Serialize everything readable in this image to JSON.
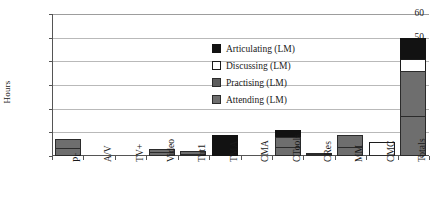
{
  "chart_data": {
    "type": "bar",
    "subtype": "stacked-bar",
    "title": "",
    "xlabel": "",
    "ylabel": "Hours",
    "ylim": [
      0,
      60
    ],
    "ytick_values": [
      0,
      10,
      20,
      30,
      40,
      50,
      60
    ],
    "ytick_labels": [
      "0",
      "10",
      "20",
      "30",
      "40",
      "50",
      "60"
    ],
    "grid": true,
    "legend_position": "inside-upper-right",
    "categories": [
      "Pr",
      "A/V",
      "TV+",
      "Video",
      "Tut1",
      "TMA",
      "CMA",
      "CTools",
      "CRes",
      "MM",
      "CMC",
      "Totals"
    ],
    "series": [
      {
        "name": "Attending (LM)",
        "color": "#6e6e6e",
        "values": [
          3.5,
          0,
          0,
          1.5,
          1,
          0,
          0,
          4,
          0.5,
          4,
          0,
          17
        ]
      },
      {
        "name": "Practising (LM)",
        "color": "#5d5d5d",
        "values": [
          3.5,
          0,
          0,
          1.5,
          1,
          0,
          0,
          4,
          0.5,
          5,
          0,
          19
        ]
      },
      {
        "name": "Discussing (LM)",
        "color": "#ffffff",
        "values": [
          0,
          0,
          0,
          0,
          0,
          0,
          0,
          0,
          0,
          0,
          6,
          5
        ]
      },
      {
        "name": "Articulating (LM)",
        "color": "#121212",
        "values": [
          0,
          0,
          0,
          0,
          0,
          9,
          0,
          3,
          0,
          0,
          0,
          9
        ]
      }
    ],
    "totals": [
      7,
      0,
      0,
      3,
      2,
      9,
      0,
      11,
      1,
      9,
      6,
      50
    ]
  },
  "legend": {
    "items": [
      {
        "label": "Articulating (LM)",
        "key": "articulating"
      },
      {
        "label": "Discussing (LM)",
        "key": "discussing"
      },
      {
        "label": "Practising (LM)",
        "key": "practising"
      },
      {
        "label": "Attending (LM)",
        "key": "attending"
      }
    ]
  }
}
